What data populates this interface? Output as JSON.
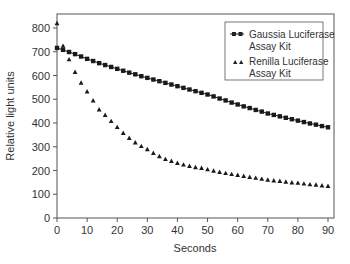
{
  "chart_data": {
    "type": "scatter",
    "title": "",
    "xlabel": "Seconds",
    "ylabel": "Relative light units",
    "xlim": [
      0,
      90
    ],
    "ylim": [
      0,
      800
    ],
    "xticks": [
      0,
      10,
      20,
      30,
      40,
      50,
      60,
      70,
      80,
      90
    ],
    "yticks": [
      0,
      100,
      200,
      300,
      400,
      500,
      600,
      700,
      800
    ],
    "grid": false,
    "legend_position": "top-right",
    "x": [
      0,
      2,
      4,
      6,
      8,
      10,
      12,
      14,
      16,
      18,
      20,
      22,
      24,
      26,
      28,
      30,
      32,
      34,
      36,
      38,
      40,
      42,
      44,
      46,
      48,
      50,
      52,
      54,
      56,
      58,
      60,
      62,
      64,
      66,
      68,
      70,
      72,
      74,
      76,
      78,
      80,
      82,
      84,
      86,
      88,
      90
    ],
    "series": [
      {
        "name": "Gaussia Luciferase Assay Kit",
        "marker": "square",
        "line": true,
        "values": [
          716,
          708,
          699,
          690,
          680,
          670,
          661,
          652,
          644,
          636,
          628,
          620,
          612,
          605,
          597,
          590,
          583,
          576,
          569,
          562,
          555,
          548,
          541,
          534,
          527,
          520,
          512,
          503,
          495,
          486,
          478,
          470,
          463,
          455,
          448,
          440,
          434,
          428,
          422,
          416,
          410,
          404,
          398,
          393,
          387,
          382
        ]
      },
      {
        "name": "Renilla Luciferase Assay Kit",
        "marker": "triangle",
        "line": false,
        "values": [
          820,
          725,
          668,
          615,
          570,
          533,
          495,
          457,
          434,
          408,
          383,
          358,
          337,
          318,
          303,
          290,
          274,
          260,
          248,
          240,
          232,
          225,
          219,
          214,
          211,
          205,
          199,
          194,
          189,
          185,
          181,
          177,
          173,
          169,
          165,
          161,
          158,
          156,
          153,
          150,
          148,
          145,
          142,
          140,
          137,
          135
        ]
      }
    ]
  }
}
